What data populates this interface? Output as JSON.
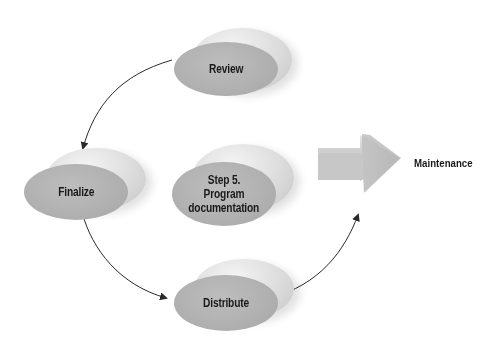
{
  "diagram": {
    "type": "cycle",
    "center_node": {
      "label": "Step 5. Program documentation",
      "lines": [
        "Step 5.",
        "Program",
        "documentation"
      ]
    },
    "nodes": [
      {
        "id": "review",
        "label": "Review"
      },
      {
        "id": "finalize",
        "label": "Finalize"
      },
      {
        "id": "distribute",
        "label": "Distribute"
      }
    ],
    "edges": [
      {
        "from": "review",
        "to": "finalize"
      },
      {
        "from": "finalize",
        "to": "distribute"
      },
      {
        "from": "distribute",
        "to": "maintenance"
      }
    ],
    "output": {
      "label": "Maintenance"
    },
    "colors": {
      "node_fill": "#b0b0b0",
      "node_back": "#dcdcdc",
      "arrow": "#333333",
      "big_arrow": "#c8c8c8"
    }
  }
}
